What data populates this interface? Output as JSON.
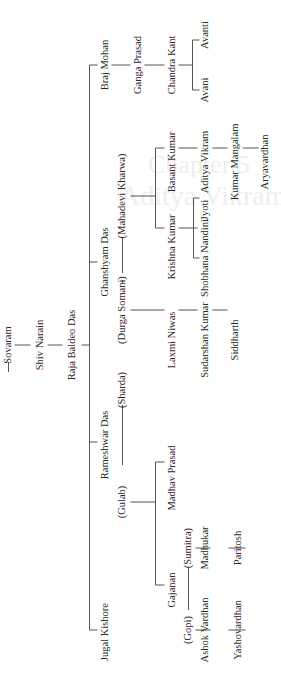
{
  "watermark": {
    "chapter": "Chapter 5",
    "title": "Aditya Vikram Birla"
  },
  "tree": {
    "orientation": "rotated -90deg (read bottom-to-top)",
    "nodes": [
      {
        "id": "sovaram",
        "label": "Sovaram",
        "x": 8,
        "y": 345
      },
      {
        "id": "shiv-narain",
        "label": "Shiv Narain",
        "x": 40,
        "y": 345
      },
      {
        "id": "raja-baldeo-das",
        "label": "Raja Baldeo Das",
        "x": 72,
        "y": 345
      },
      {
        "id": "braj-mohan",
        "label": "Braj Mohan",
        "x": 105,
        "y": 65
      },
      {
        "id": "ganga-prasad",
        "label": "Ganga Prasad",
        "x": 138,
        "y": 65
      },
      {
        "id": "chandra-kant",
        "label": "Chandra Kant",
        "x": 172,
        "y": 65
      },
      {
        "id": "avanti",
        "label": "Avanti",
        "x": 205,
        "y": 35
      },
      {
        "id": "avani",
        "label": "Avani",
        "x": 205,
        "y": 90
      },
      {
        "id": "ghanshyam-das",
        "label": "Ghanshyam Das",
        "x": 105,
        "y": 262
      },
      {
        "id": "mahadevi-kharwa",
        "label": "(Mahadevi Kharwa)",
        "x": 122,
        "y": 196
      },
      {
        "id": "durga-somani",
        "label": "(Durga Somani)",
        "x": 122,
        "y": 310
      },
      {
        "id": "basant-kumar",
        "label": "Basant Kumar",
        "x": 172,
        "y": 162
      },
      {
        "id": "krishna-kumar",
        "label": "Krishna Kumar",
        "x": 172,
        "y": 247
      },
      {
        "id": "aditya-vikram",
        "label": "Aditya Vikram",
        "x": 205,
        "y": 162
      },
      {
        "id": "kumar-mangalam",
        "label": "Kumar Mangalam",
        "x": 235,
        "y": 162
      },
      {
        "id": "aryavardhan",
        "label": "Aryavardhan",
        "x": 265,
        "y": 162
      },
      {
        "id": "jyoti",
        "label": "Jyoti",
        "x": 205,
        "y": 210
      },
      {
        "id": "shobhana-nandini",
        "label": "Shobhana Nandini",
        "x": 205,
        "y": 258
      },
      {
        "id": "laxmi-niwas",
        "label": "Laxmi Niwas",
        "x": 172,
        "y": 340
      },
      {
        "id": "sudarshan-kumar",
        "label": "Sudarshan Kumar",
        "x": 205,
        "y": 340
      },
      {
        "id": "siddharth",
        "label": "Siddharth",
        "x": 235,
        "y": 340
      },
      {
        "id": "rameshwar-das",
        "label": "Rameshwar Das",
        "x": 105,
        "y": 445
      },
      {
        "id": "sharda",
        "label": "(Sharda)",
        "x": 122,
        "y": 390
      },
      {
        "id": "gulab",
        "label": "(Gulab)",
        "x": 122,
        "y": 502
      },
      {
        "id": "madhav-prasad",
        "label": "Madhav Prasad",
        "x": 172,
        "y": 478
      },
      {
        "id": "gajanan",
        "label": "Gajanan",
        "x": 172,
        "y": 590
      },
      {
        "id": "sumitra",
        "label": "(Sumitra)",
        "x": 188,
        "y": 548
      },
      {
        "id": "gopi",
        "label": "(Gopi)",
        "x": 188,
        "y": 630
      },
      {
        "id": "madhukar",
        "label": "Madhukar",
        "x": 205,
        "y": 548
      },
      {
        "id": "paritosh",
        "label": "Paritosh",
        "x": 238,
        "y": 548
      },
      {
        "id": "ashok-vardhan",
        "label": "Ashok Vardhan",
        "x": 205,
        "y": 630
      },
      {
        "id": "yashovardhan",
        "label": "Yashovardhan",
        "x": 238,
        "y": 630
      },
      {
        "id": "jugal-kishore",
        "label": "Jugal Kishore",
        "x": 105,
        "y": 632
      }
    ],
    "lines": [
      [
        8,
        362,
        8,
        372
      ],
      [
        14,
        345,
        30,
        345
      ],
      [
        47,
        345,
        62,
        345
      ],
      [
        81,
        345,
        89,
        345
      ],
      [
        89,
        65,
        89,
        630
      ],
      [
        89,
        65,
        97,
        65
      ],
      [
        89,
        262,
        97,
        262
      ],
      [
        89,
        442,
        97,
        442
      ],
      [
        89,
        630,
        97,
        630
      ],
      [
        111,
        65,
        130,
        65
      ],
      [
        144,
        65,
        164,
        65
      ],
      [
        178,
        65,
        192,
        65
      ],
      [
        192,
        40,
        192,
        90
      ],
      [
        192,
        40,
        199,
        40
      ],
      [
        192,
        90,
        199,
        90
      ],
      [
        122,
        237,
        122,
        273
      ],
      [
        122,
        280,
        122,
        283
      ],
      [
        130,
        196,
        155,
        196
      ],
      [
        155,
        148,
        155,
        228
      ],
      [
        155,
        148,
        164,
        148
      ],
      [
        155,
        228,
        164,
        228
      ],
      [
        178,
        148,
        197,
        148
      ],
      [
        212,
        148,
        227,
        148
      ],
      [
        242,
        148,
        258,
        148
      ],
      [
        178,
        228,
        197,
        228
      ],
      [
        193,
        198,
        193,
        258
      ],
      [
        193,
        198,
        199,
        198
      ],
      [
        193,
        258,
        199,
        258
      ],
      [
        130,
        310,
        164,
        310
      ],
      [
        178,
        310,
        197,
        310
      ],
      [
        212,
        310,
        227,
        310
      ],
      [
        122,
        405,
        122,
        465
      ],
      [
        130,
        502,
        155,
        502
      ],
      [
        155,
        462,
        155,
        585
      ],
      [
        155,
        462,
        164,
        462
      ],
      [
        155,
        585,
        164,
        585
      ],
      [
        188,
        568,
        188,
        610
      ],
      [
        195,
        548,
        210,
        548
      ],
      [
        228,
        548,
        245,
        548
      ],
      [
        195,
        630,
        210,
        630
      ],
      [
        228,
        630,
        245,
        630
      ]
    ]
  }
}
